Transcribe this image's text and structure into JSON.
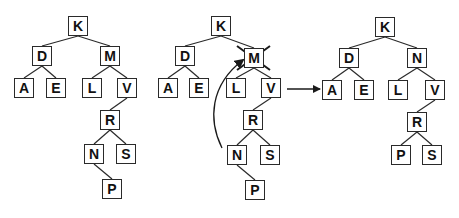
{
  "diagram": {
    "colors": {
      "stroke": "#2a2a2a",
      "text": "#111111",
      "background": "#ffffff"
    },
    "trees": [
      {
        "name": "before",
        "nodes": [
          {
            "id": "K",
            "label": "K",
            "x": 68,
            "y": 16
          },
          {
            "id": "D",
            "label": "D",
            "x": 32,
            "y": 46
          },
          {
            "id": "M",
            "label": "M",
            "x": 100,
            "y": 46
          },
          {
            "id": "A",
            "label": "A",
            "x": 14,
            "y": 78
          },
          {
            "id": "E",
            "label": "E",
            "x": 46,
            "y": 78
          },
          {
            "id": "L",
            "label": "L",
            "x": 82,
            "y": 78
          },
          {
            "id": "V",
            "label": "V",
            "x": 117,
            "y": 78
          },
          {
            "id": "R",
            "label": "R",
            "x": 100,
            "y": 110
          },
          {
            "id": "N",
            "label": "N",
            "x": 84,
            "y": 144
          },
          {
            "id": "S",
            "label": "S",
            "x": 116,
            "y": 144
          },
          {
            "id": "P",
            "label": "P",
            "x": 102,
            "y": 179
          }
        ],
        "edges": [
          [
            "K",
            "D"
          ],
          [
            "K",
            "M"
          ],
          [
            "D",
            "A"
          ],
          [
            "D",
            "E"
          ],
          [
            "M",
            "L"
          ],
          [
            "M",
            "V"
          ],
          [
            "V",
            "R"
          ],
          [
            "R",
            "N"
          ],
          [
            "R",
            "S"
          ],
          [
            "N",
            "P"
          ]
        ]
      },
      {
        "name": "during",
        "nodes": [
          {
            "id": "K",
            "label": "K",
            "x": 211,
            "y": 16
          },
          {
            "id": "D",
            "label": "D",
            "x": 175,
            "y": 46
          },
          {
            "id": "M",
            "label": "M",
            "x": 244,
            "y": 48,
            "crossed": true
          },
          {
            "id": "A",
            "label": "A",
            "x": 158,
            "y": 78
          },
          {
            "id": "E",
            "label": "E",
            "x": 189,
            "y": 78
          },
          {
            "id": "L",
            "label": "L",
            "x": 226,
            "y": 78
          },
          {
            "id": "V",
            "label": "V",
            "x": 261,
            "y": 78
          },
          {
            "id": "R",
            "label": "R",
            "x": 243,
            "y": 110
          },
          {
            "id": "N",
            "label": "N",
            "x": 227,
            "y": 145
          },
          {
            "id": "S",
            "label": "S",
            "x": 260,
            "y": 145
          },
          {
            "id": "P",
            "label": "P",
            "x": 245,
            "y": 180
          }
        ],
        "edges": [
          [
            "K",
            "D"
          ],
          [
            "K",
            "M"
          ],
          [
            "D",
            "A"
          ],
          [
            "D",
            "E"
          ],
          [
            "M",
            "L"
          ],
          [
            "M",
            "V"
          ],
          [
            "V",
            "R"
          ],
          [
            "R",
            "N"
          ],
          [
            "R",
            "S"
          ],
          [
            "N",
            "P"
          ]
        ],
        "annotation": "curved arrow from N up to M indicating N replaces M"
      },
      {
        "name": "after",
        "nodes": [
          {
            "id": "K",
            "label": "K",
            "x": 375,
            "y": 17
          },
          {
            "id": "D",
            "label": "D",
            "x": 339,
            "y": 48
          },
          {
            "id": "N",
            "label": "N",
            "x": 407,
            "y": 48
          },
          {
            "id": "A",
            "label": "A",
            "x": 322,
            "y": 80
          },
          {
            "id": "E",
            "label": "E",
            "x": 354,
            "y": 80
          },
          {
            "id": "L",
            "label": "L",
            "x": 388,
            "y": 80
          },
          {
            "id": "V",
            "label": "V",
            "x": 425,
            "y": 80
          },
          {
            "id": "R",
            "label": "R",
            "x": 407,
            "y": 112
          },
          {
            "id": "P",
            "label": "P",
            "x": 391,
            "y": 145
          },
          {
            "id": "S",
            "label": "S",
            "x": 422,
            "y": 145
          }
        ],
        "edges": [
          [
            "K",
            "D"
          ],
          [
            "K",
            "N"
          ],
          [
            "D",
            "A"
          ],
          [
            "D",
            "E"
          ],
          [
            "N",
            "L"
          ],
          [
            "N",
            "V"
          ],
          [
            "V",
            "R"
          ],
          [
            "R",
            "P"
          ],
          [
            "R",
            "S"
          ]
        ]
      }
    ],
    "transition_arrow": {
      "from": [
        287,
        89
      ],
      "to": [
        320,
        89
      ]
    }
  }
}
